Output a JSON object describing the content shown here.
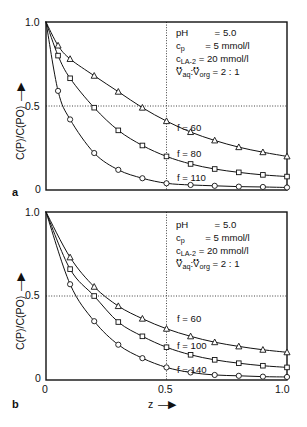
{
  "figure": {
    "width": 307,
    "height": 427,
    "background": "#ffffff",
    "ink": "#111111"
  },
  "axis": {
    "ylabel": "C(P)/C(PO)",
    "xlabel": "z",
    "y_ticks": [
      "0",
      "0.5",
      "1.0"
    ],
    "x_ticks": [
      "0",
      "0.5",
      "1.0"
    ],
    "y_tick_top": "1.0",
    "y_tick_mid": "0.5",
    "y_tick_bottom": "0",
    "x_tick_left": "0",
    "x_tick_mid": "0.5",
    "x_tick_right": "1.0",
    "arrow_glyph": "→"
  },
  "panels": [
    {
      "letter": "a",
      "annotation": {
        "line1_name": "pH",
        "line1_eq": "=",
        "line1_value": "5.0",
        "line2_name": "c",
        "line2_sub": "p",
        "line2_eq": "=",
        "line2_value": "5 mmol/l",
        "line3_name": "c",
        "line3_sub": "LA-2",
        "line3_eq": "=",
        "line3_value": "20 mmol/l",
        "line4_name": "V",
        "line4_sub_a": "aq",
        "line4_sep": ":",
        "line4_name_b": "V",
        "line4_sub_b": "org",
        "line4_eq": "=",
        "line4_value": "2 : 1"
      },
      "curve_labels": [
        "f = 60",
        "f = 80",
        "f = 110"
      ]
    },
    {
      "letter": "b",
      "annotation": {
        "line1_name": "pH",
        "line1_eq": "=",
        "line1_value": "5.0",
        "line2_name": "c",
        "line2_sub": "p",
        "line2_eq": "=",
        "line2_value": "5 mmol/l",
        "line3_name": "c",
        "line3_sub": "LA-2",
        "line3_eq": "=",
        "line3_value": "20 mmol/l",
        "line4_name": "V",
        "line4_sub_a": "aq",
        "line4_sep": ":",
        "line4_name_b": "V",
        "line4_sub_b": "org",
        "line4_eq": "=",
        "line4_value": "2 : 1"
      },
      "curve_labels": [
        "f = 60",
        "f = 100",
        "f = 140"
      ]
    }
  ],
  "chart_data": [
    {
      "type": "line",
      "panel": "a",
      "title": "",
      "xlabel": "z",
      "ylabel": "C(P)/C(PO)",
      "xlim": [
        0,
        1.0
      ],
      "ylim": [
        0,
        1.0
      ],
      "grid": false,
      "reference_lines": {
        "horizontal": [
          0.5
        ],
        "vertical": [
          0.5
        ],
        "style": "dotted"
      },
      "legend_position": "inline-curve-labels",
      "series": [
        {
          "name": "f = 60",
          "marker": "triangle",
          "x": [
            0.0,
            0.05,
            0.1,
            0.2,
            0.3,
            0.4,
            0.5,
            0.6,
            0.7,
            0.8,
            0.9,
            1.0
          ],
          "y": [
            1.0,
            0.86,
            0.78,
            0.68,
            0.585,
            0.49,
            0.41,
            0.345,
            0.295,
            0.255,
            0.225,
            0.2
          ]
        },
        {
          "name": "f = 80",
          "marker": "square",
          "x": [
            0.0,
            0.05,
            0.1,
            0.2,
            0.3,
            0.4,
            0.5,
            0.6,
            0.7,
            0.8,
            0.9,
            1.0
          ],
          "y": [
            1.0,
            0.8,
            0.665,
            0.49,
            0.355,
            0.265,
            0.2,
            0.155,
            0.125,
            0.105,
            0.09,
            0.08
          ]
        },
        {
          "name": "f = 110",
          "marker": "circle",
          "x": [
            0.0,
            0.05,
            0.1,
            0.2,
            0.3,
            0.4,
            0.5,
            0.6,
            0.7,
            0.8,
            0.9,
            1.0
          ],
          "y": [
            1.0,
            0.59,
            0.42,
            0.22,
            0.12,
            0.07,
            0.04,
            0.03,
            0.025,
            0.02,
            0.018,
            0.015
          ]
        }
      ]
    },
    {
      "type": "line",
      "panel": "b",
      "title": "",
      "xlabel": "z",
      "ylabel": "C(P)/C(PO)",
      "xlim": [
        0,
        1.0
      ],
      "ylim": [
        0,
        1.0
      ],
      "grid": false,
      "reference_lines": {
        "horizontal": [
          0.5
        ],
        "vertical": [
          0.5
        ],
        "style": "dotted"
      },
      "legend_position": "inline-curve-labels",
      "series": [
        {
          "name": "f = 60",
          "marker": "triangle",
          "x": [
            0.0,
            0.1,
            0.2,
            0.3,
            0.4,
            0.5,
            0.6,
            0.7,
            0.8,
            0.9,
            1.0
          ],
          "y": [
            1.0,
            0.73,
            0.555,
            0.44,
            0.365,
            0.305,
            0.26,
            0.225,
            0.2,
            0.18,
            0.165
          ]
        },
        {
          "name": "f = 100",
          "marker": "square",
          "x": [
            0.0,
            0.1,
            0.2,
            0.3,
            0.4,
            0.5,
            0.6,
            0.7,
            0.8,
            0.9,
            1.0
          ],
          "y": [
            1.0,
            0.66,
            0.5,
            0.345,
            0.26,
            0.195,
            0.15,
            0.12,
            0.1,
            0.085,
            0.075
          ]
        },
        {
          "name": "f = 140",
          "marker": "circle",
          "x": [
            0.0,
            0.1,
            0.2,
            0.3,
            0.4,
            0.5,
            0.6,
            0.7,
            0.8,
            0.9,
            1.0
          ],
          "y": [
            1.0,
            0.57,
            0.35,
            0.21,
            0.13,
            0.075,
            0.045,
            0.03,
            0.025,
            0.02,
            0.018
          ]
        }
      ]
    }
  ]
}
